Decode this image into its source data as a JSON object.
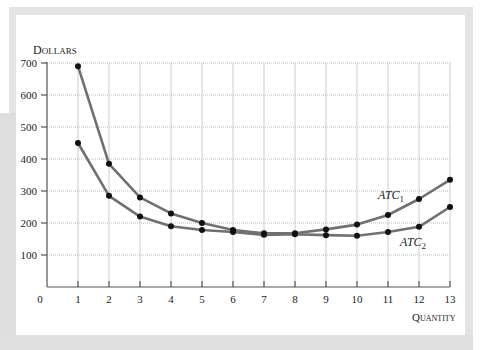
{
  "chart_data": {
    "type": "line",
    "title": "",
    "xlabel": "Quantity",
    "ylabel": "Dollars",
    "x": [
      1,
      2,
      3,
      4,
      5,
      6,
      7,
      8,
      9,
      10,
      11,
      12,
      13
    ],
    "x_ticks": [
      "0",
      "1",
      "2",
      "3",
      "4",
      "5",
      "6",
      "7",
      "8",
      "9",
      "10",
      "11",
      "12",
      "13"
    ],
    "y_ticks": [
      "100",
      "200",
      "300",
      "400",
      "500",
      "600",
      "700"
    ],
    "xlim": [
      0,
      13
    ],
    "ylim": [
      0,
      700
    ],
    "grid": true,
    "legend": "inline labels",
    "series": [
      {
        "name": "ATC1",
        "label_main": "ATC",
        "label_sub": "1",
        "values": [
          690,
          385,
          280,
          230,
          200,
          178,
          168,
          168,
          180,
          195,
          225,
          275,
          335
        ]
      },
      {
        "name": "ATC2",
        "label_main": "ATC",
        "label_sub": "2",
        "values": [
          450,
          285,
          220,
          190,
          178,
          172,
          163,
          165,
          162,
          160,
          172,
          188,
          250
        ]
      }
    ],
    "colors": {
      "line": "#707070",
      "marker": "#111111",
      "grid": "#cccccc",
      "axis": "#555555"
    }
  },
  "labels": {
    "ylabel_cap": "D",
    "ylabel_rest": "OLLARS",
    "xlabel_cap": "Q",
    "xlabel_rest": "UANTITY",
    "origin": "0"
  }
}
